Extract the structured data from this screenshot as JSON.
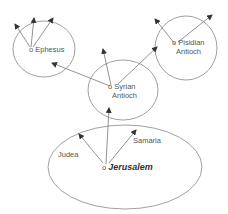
{
  "diagram": {
    "title": "",
    "nodes": [
      {
        "id": "ephesus",
        "label": "Ephesus"
      },
      {
        "id": "pisidian_antioch",
        "label_line1": "Pisidian",
        "label_line2": "Antioch"
      },
      {
        "id": "syrian_antioch",
        "label_line1": "Syrian",
        "label_line2": "Antioch"
      },
      {
        "id": "jerusalem",
        "label": "Jerusalem"
      }
    ],
    "regions": [
      {
        "id": "judea",
        "label": "Judea"
      },
      {
        "id": "samaria",
        "label": "Samaria"
      }
    ],
    "marker": "o",
    "edges": [
      {
        "from": "jerusalem",
        "to": "syrian_antioch"
      },
      {
        "from": "jerusalem",
        "to": "judea"
      },
      {
        "from": "jerusalem",
        "to": "samaria"
      },
      {
        "from": "syrian_antioch",
        "to": "ephesus"
      },
      {
        "from": "syrian_antioch",
        "to": "pisidian_antioch"
      },
      {
        "from": "syrian_antioch",
        "to": "north"
      },
      {
        "from": "pisidian_antioch",
        "to": "outward"
      },
      {
        "from": "ephesus",
        "to": "outward"
      }
    ],
    "colors": {
      "line": "#777777",
      "arrow": "#333333",
      "text": "#555555"
    }
  }
}
